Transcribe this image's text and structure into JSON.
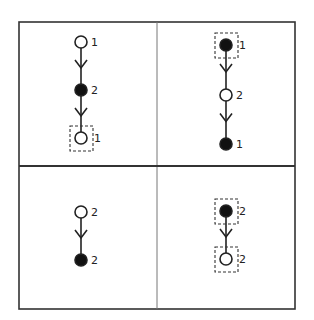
{
  "diagram": {
    "type": "grid-of-chains",
    "rows": 2,
    "cols": 2,
    "frame": {
      "x": 19,
      "y": 22,
      "width": 276,
      "height": 287
    },
    "dividers": {
      "vertical_x": 157,
      "horizontal_y": 166
    },
    "colors": {
      "stroke": "#222222",
      "filled_node": "#111111",
      "hollow_node": "#ffffff",
      "background": "#ffffff"
    },
    "panels": [
      {
        "id": "top-left",
        "nodes": [
          {
            "x": 81,
            "y": 42,
            "filled": false,
            "label": "1",
            "highlighted": false
          },
          {
            "x": 81,
            "y": 90,
            "filled": true,
            "label": "2",
            "highlighted": false
          },
          {
            "x": 81,
            "y": 138,
            "filled": false,
            "label": "1",
            "highlighted": true
          }
        ]
      },
      {
        "id": "top-right",
        "nodes": [
          {
            "x": 226,
            "y": 45,
            "filled": true,
            "label": "1",
            "highlighted": true
          },
          {
            "x": 226,
            "y": 95,
            "filled": false,
            "label": "2",
            "highlighted": false
          },
          {
            "x": 226,
            "y": 144,
            "filled": true,
            "label": "1",
            "highlighted": false
          }
        ]
      },
      {
        "id": "bottom-left",
        "nodes": [
          {
            "x": 81,
            "y": 212,
            "filled": false,
            "label": "2",
            "highlighted": false
          },
          {
            "x": 81,
            "y": 260,
            "filled": true,
            "label": "2",
            "highlighted": false
          }
        ]
      },
      {
        "id": "bottom-right",
        "nodes": [
          {
            "x": 226,
            "y": 211,
            "filled": true,
            "label": "2",
            "highlighted": true
          },
          {
            "x": 226,
            "y": 259,
            "filled": false,
            "label": "2",
            "highlighted": true
          }
        ]
      }
    ]
  }
}
